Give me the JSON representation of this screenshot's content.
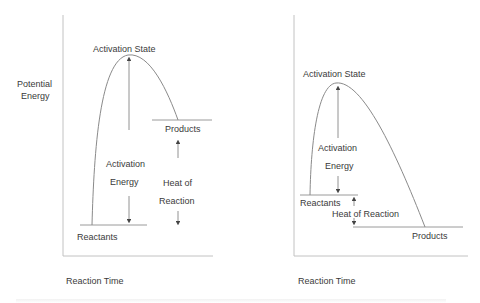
{
  "diagrams": [
    {
      "id": "endothermic",
      "y_axis_label_line1": "Potential",
      "y_axis_label_line2": "Energy",
      "x_axis_label": "Reaction Time",
      "peak_label": "Activation State",
      "activation_label_line1": "Activation",
      "activation_label_line2": "Energy",
      "heat_label_line1": "Heat of",
      "heat_label_line2": "Reaction",
      "reactants_label": "Reactants",
      "products_label": "Products"
    },
    {
      "id": "exothermic",
      "x_axis_label": "Reaction Time",
      "peak_label": "Activation State",
      "activation_label_line1": "Activation",
      "activation_label_line2": "Energy",
      "heat_label": "Heat of Reaction",
      "reactants_label": "Reactants",
      "products_label": "Products"
    }
  ],
  "colors": {
    "axis": "#bdbdbd",
    "curve": "#8a8a8a",
    "level_line": "#9a9a9a",
    "arrow": "#555555",
    "text": "#3a3a3a"
  }
}
